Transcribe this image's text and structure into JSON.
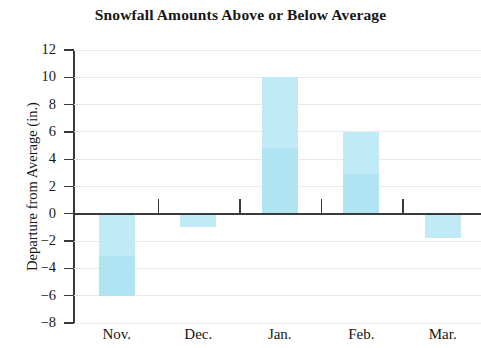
{
  "chart_data": {
    "type": "bar",
    "title": "Snowfall Amounts Above or Below Average",
    "xlabel": "",
    "ylabel": "Departure from Average (in.)",
    "categories": [
      "Nov.",
      "Dec.",
      "Jan.",
      "Feb.",
      "Mar."
    ],
    "values": [
      -6,
      -1,
      10,
      6,
      -1.8
    ],
    "ylim": [
      -8,
      12
    ],
    "ytick_step": 2,
    "yticks": [
      12,
      10,
      8,
      6,
      4,
      2,
      0,
      -2,
      -4,
      -6,
      -8
    ],
    "ytick_labels": [
      "12",
      "10",
      "8",
      "6",
      "4",
      "2",
      "0",
      "−2",
      "−4",
      "−6",
      "−8"
    ],
    "grid": true,
    "legend": false,
    "bar_color": "#bfeaf6",
    "axis_color": "#3a3a3a",
    "grid_color": "#e9e9e9"
  }
}
